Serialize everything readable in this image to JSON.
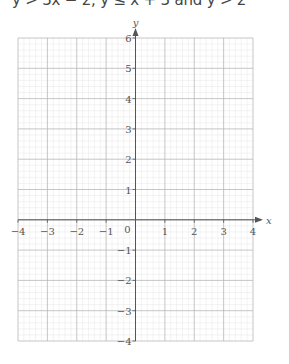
{
  "problem": {
    "text": "y > 3x − 2, y ≤ x + 3 and y > 2"
  },
  "graph": {
    "x_axis_label": "x",
    "y_axis_label": "y",
    "origin_label": "0",
    "x_range": [
      -4,
      4
    ],
    "y_range": [
      -4,
      6
    ],
    "x_ticks": [
      "−4",
      "−3",
      "−2",
      "−1",
      "1",
      "2",
      "3",
      "4"
    ],
    "y_ticks": [
      "6",
      "5",
      "4",
      "3",
      "2",
      "1",
      "−1",
      "−2",
      "−3",
      "−4"
    ],
    "minor_divisions_per_unit": 5,
    "colors": {
      "major_grid": "#b8b8b8",
      "minor_grid": "#e6e6e6",
      "axis": "#555555"
    }
  },
  "chart_data": {
    "type": "scatter",
    "title": "y > 3x − 2, y ≤ x + 3 and y > 2",
    "xlabel": "x",
    "ylabel": "y",
    "xlim": [
      -4,
      4
    ],
    "ylim": [
      -4,
      6
    ],
    "x_ticks": [
      -4,
      -3,
      -2,
      -1,
      0,
      1,
      2,
      3,
      4
    ],
    "y_ticks": [
      -4,
      -3,
      -2,
      -1,
      0,
      1,
      2,
      3,
      4,
      5,
      6
    ],
    "grid": true,
    "series": []
  }
}
